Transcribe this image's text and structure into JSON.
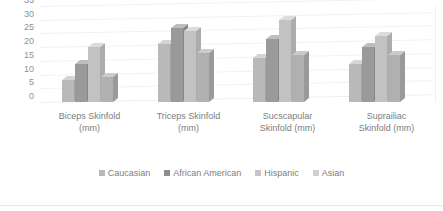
{
  "chart_data": {
    "type": "bar",
    "title": "",
    "subtitle": "",
    "xlabel": "",
    "ylabel": "",
    "ylim": [
      0,
      35
    ],
    "ytick_step": 5,
    "yticks": [
      "35",
      "30",
      "25",
      "20",
      "15",
      "10",
      "5",
      "0"
    ],
    "grid": true,
    "three_d": true,
    "legend_position": "bottom",
    "categories": [
      "Biceps Skinfold\n(mm)",
      "Triceps Skinfold\n(mm)",
      "Sucscapular\nSkinfold (mm)",
      "Suprailiac\nSkinfold (mm)"
    ],
    "series": [
      {
        "name": "Caucasian",
        "color": "#b9b9b9",
        "values": [
          8,
          21,
          16,
          14
        ]
      },
      {
        "name": "African American",
        "color": "#8d8d8d",
        "values": [
          14,
          27,
          23,
          20
        ]
      },
      {
        "name": "Hispanic",
        "color": "#c4c4c4",
        "values": [
          20,
          26,
          30,
          24
        ]
      },
      {
        "name": "Asian",
        "color": "#d0d0d0",
        "values": [
          9,
          18,
          17,
          17
        ]
      }
    ]
  },
  "legend": {
    "items": [
      {
        "label": "Caucasian"
      },
      {
        "label": "African American"
      },
      {
        "label": "Hispanic"
      },
      {
        "label": "Asian"
      }
    ]
  }
}
